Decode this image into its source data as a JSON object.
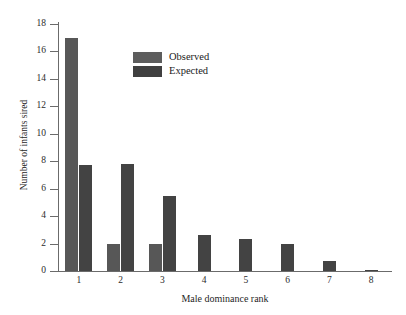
{
  "chart_data": {
    "type": "bar",
    "title": "",
    "subtitle": "",
    "xlabel": "Male dominance rank",
    "ylabel": "Number of infants sired",
    "categories": [
      "1",
      "2",
      "3",
      "4",
      "5",
      "6",
      "7",
      "8"
    ],
    "series": [
      {
        "name": "Observed",
        "color": "#575757",
        "values": [
          17,
          2,
          2,
          0,
          0,
          0,
          0,
          0
        ]
      },
      {
        "name": "Expected",
        "color": "#434343",
        "values": [
          7.7,
          7.8,
          5.5,
          2.6,
          2.3,
          2.0,
          0.7,
          0.1
        ]
      }
    ],
    "ylim": [
      0,
      18
    ],
    "yticks": [
      0,
      2,
      4,
      6,
      8,
      10,
      12,
      14,
      16,
      18
    ],
    "ytick_labels": [
      "0",
      "2",
      "4",
      "6",
      "8",
      "10",
      "12",
      "14",
      "16",
      "18"
    ],
    "grid": false,
    "legend_position": "inside-top-center",
    "legend_entries": [
      "Observed",
      "Expected"
    ],
    "background": "#ffffff",
    "axis_color": "#6b6b6b"
  }
}
